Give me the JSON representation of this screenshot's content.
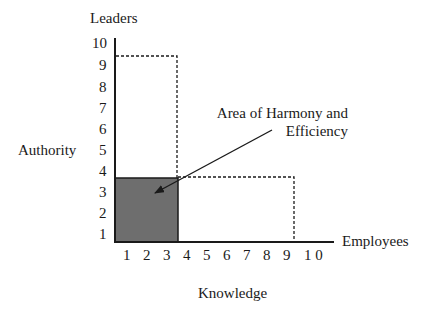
{
  "diagram": {
    "y_axis_top_label": "Leaders",
    "y_axis_side_label": "Authority",
    "x_axis_end_label": "Employees",
    "x_axis_bottom_label": "Knowledge",
    "y_ticks": [
      "10",
      "9",
      "8",
      "7",
      "6",
      "5",
      "4",
      "3",
      "2",
      "1"
    ],
    "x_ticks": [
      "1",
      "2",
      "3",
      "4",
      "5",
      "6",
      "7",
      "8",
      "9",
      "1 0"
    ],
    "annotation": {
      "line1": "Area of Harmony and",
      "line2": "Efficiency"
    },
    "regions": {
      "leaders_box": {
        "x_max": 3.5,
        "y_max": 9.3,
        "style": "dashed"
      },
      "employees_box": {
        "x_max": 9.2,
        "y_max": 3.6,
        "style": "dashed"
      },
      "harmony_area": {
        "x_max": 3.5,
        "y_max": 3.6,
        "fill": "#6e6e6e"
      }
    },
    "colors": {
      "axis": "#1a1a1a",
      "shaded_fill": "#6e6e6e",
      "background": "#ffffff"
    }
  }
}
